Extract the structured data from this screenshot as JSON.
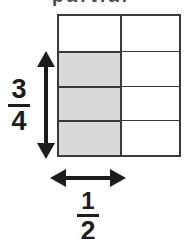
{
  "figure": {
    "type": "fraction-area-model",
    "caption_fragment": "partial",
    "background_color": "#ffffff",
    "line_color": "#3a3a3a",
    "shade_color": "#d9d9d9",
    "text_color": "#1c1c1c"
  },
  "grid": {
    "rows": 4,
    "columns": 2,
    "total_cells": 8,
    "shaded_cells": 3,
    "shaded_positions": "left column, rows 2-4",
    "cells": [
      {
        "row": 1,
        "col": 1,
        "shaded": false
      },
      {
        "row": 1,
        "col": 2,
        "shaded": false
      },
      {
        "row": 2,
        "col": 1,
        "shaded": true
      },
      {
        "row": 2,
        "col": 2,
        "shaded": false
      },
      {
        "row": 3,
        "col": 1,
        "shaded": true
      },
      {
        "row": 3,
        "col": 2,
        "shaded": false
      },
      {
        "row": 4,
        "col": 1,
        "shaded": true
      },
      {
        "row": 4,
        "col": 2,
        "shaded": false
      }
    ]
  },
  "vertical_dimension": {
    "label_numerator": "3",
    "label_denominator": "4",
    "label_text": "3/4",
    "arrow": "double-headed-vertical",
    "spans": "3 of 4 rows"
  },
  "horizontal_dimension": {
    "label_numerator": "1",
    "label_denominator": "2",
    "label_text": "1/2",
    "arrow": "double-headed-horizontal",
    "spans": "1 of 2 columns"
  }
}
